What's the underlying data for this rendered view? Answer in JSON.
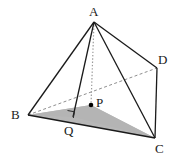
{
  "figure": {
    "type": "geometry-diagram",
    "canvas": {
      "width": 174,
      "height": 160
    },
    "colors": {
      "stroke": "#1a1a1a",
      "hidden_stroke": "#8a8a8a",
      "shaded_fill": "#b0b0b0",
      "background": "#ffffff",
      "point_fill": "#000000"
    },
    "labels": [
      {
        "name": "A",
        "text": "A",
        "x": 89,
        "y": 5
      },
      {
        "name": "D",
        "text": "D",
        "x": 158,
        "y": 53
      },
      {
        "name": "P",
        "text": "P",
        "x": 96,
        "y": 96
      },
      {
        "name": "B",
        "text": "B",
        "x": 11,
        "y": 108
      },
      {
        "name": "Q",
        "text": "Q",
        "x": 64,
        "y": 124
      },
      {
        "name": "C",
        "text": "C",
        "x": 155,
        "y": 142
      }
    ],
    "points": [
      {
        "name": "A",
        "x": 94,
        "y": 22
      },
      {
        "name": "B",
        "x": 28,
        "y": 115
      },
      {
        "name": "C",
        "x": 155,
        "y": 138
      },
      {
        "name": "D",
        "x": 157,
        "y": 68
      },
      {
        "name": "P",
        "x": 91,
        "y": 105
      },
      {
        "name": "Q",
        "x": 73,
        "y": 117
      }
    ],
    "solid_edges": [
      {
        "name": "edge-AB",
        "from": "A",
        "to": "B"
      },
      {
        "name": "edge-AD",
        "from": "A",
        "to": "D"
      },
      {
        "name": "edge-AC",
        "from": "A",
        "to": "C"
      },
      {
        "name": "edge-AQ",
        "from": "A",
        "to": "Q"
      },
      {
        "name": "edge-BC",
        "from": "B",
        "to": "C"
      },
      {
        "name": "edge-DC",
        "from": "D",
        "to": "C"
      }
    ],
    "dashed_edges": [
      {
        "name": "edge-BD-hidden",
        "from": "B",
        "to": "D"
      }
    ],
    "dotted_edges": [
      {
        "name": "altitude-AP",
        "from": "A",
        "to": "P"
      }
    ],
    "shaded_region": {
      "name": "triangle-BQC-shaded",
      "vertices": [
        "B",
        "Q",
        "C",
        "P"
      ]
    },
    "right_angle_marker": {
      "name": "right-angle-at-Q",
      "at": "Q"
    },
    "marked_points": [
      {
        "name": "point-P-dot",
        "at": "P"
      }
    ]
  }
}
